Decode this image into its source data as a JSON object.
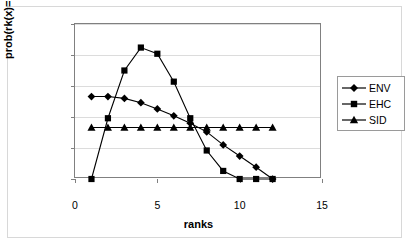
{
  "figure": {
    "title_partial": "",
    "background": "#ffffff",
    "border_color": "#d8d8d8"
  },
  "axes": {
    "x_title": "ranks",
    "y_title": "prob(rk(x)=Rk)",
    "x_ticks": [
      "0",
      "5",
      "10",
      "15"
    ],
    "y_ticks": [
      "0",
      "0,05",
      "0,1",
      "0,15",
      "0,2",
      "0,25"
    ],
    "grid_color": "#dcdcdc",
    "axis_color": "#808080"
  },
  "legend": {
    "position": "right",
    "entries": [
      {
        "label": "ENV",
        "marker": "diamond"
      },
      {
        "label": "EHC",
        "marker": "square"
      },
      {
        "label": "SID",
        "marker": "triangle"
      }
    ]
  },
  "chart_data": {
    "type": "line",
    "title": "",
    "xlabel": "ranks",
    "ylabel": "prob(rk(x)=Rk)",
    "xlim": [
      0,
      15
    ],
    "ylim": [
      0,
      0.25
    ],
    "xticks": [
      0,
      5,
      10,
      15
    ],
    "yticks": [
      0,
      0.05,
      0.1,
      0.15,
      0.2,
      0.25
    ],
    "grid": true,
    "legend_position": "right",
    "decimal_separator": ",",
    "x": [
      1,
      2,
      3,
      4,
      5,
      6,
      7,
      8,
      9,
      10,
      11,
      12
    ],
    "series": [
      {
        "name": "ENV",
        "marker": "diamond",
        "color": "#000000",
        "values": [
          0.133,
          0.133,
          0.13,
          0.123,
          0.113,
          0.102,
          0.09,
          0.076,
          0.055,
          0.037,
          0.019,
          0.0
        ]
      },
      {
        "name": "EHC",
        "marker": "square",
        "color": "#000000",
        "values": [
          0.0,
          0.098,
          0.175,
          0.212,
          0.202,
          0.157,
          0.098,
          0.046,
          0.013,
          0.0,
          0.0,
          0.0
        ]
      },
      {
        "name": "SID",
        "marker": "triangle",
        "color": "#000000",
        "values": [
          0.083,
          0.083,
          0.083,
          0.083,
          0.083,
          0.083,
          0.083,
          0.083,
          0.083,
          0.083,
          0.083,
          0.083
        ]
      }
    ]
  }
}
